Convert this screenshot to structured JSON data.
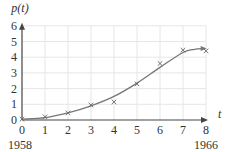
{
  "chart_data": {
    "type": "scatter",
    "title": "",
    "ylabel": "p(t)",
    "xlabel": "t",
    "x": [
      0,
      1,
      2,
      3,
      4,
      5,
      6,
      7,
      8
    ],
    "series": [
      {
        "name": "observed",
        "marker": "x",
        "values": [
          0.05,
          0.2,
          0.45,
          0.95,
          1.15,
          2.3,
          3.6,
          4.45,
          4.4
        ]
      },
      {
        "name": "fitted curve",
        "type": "line",
        "x": [
          0,
          1,
          2,
          3,
          4,
          5,
          6,
          7,
          7.5,
          7.9
        ],
        "values": [
          0.05,
          0.15,
          0.45,
          0.9,
          1.5,
          2.35,
          3.35,
          4.3,
          4.5,
          4.55
        ]
      }
    ],
    "xticks": [
      "0",
      "1",
      "2",
      "3",
      "4",
      "5",
      "6",
      "7",
      "8"
    ],
    "yticks": [
      "0",
      "1",
      "2",
      "3",
      "4",
      "5",
      "6"
    ],
    "xlim": [
      0,
      8
    ],
    "ylim": [
      0,
      6
    ],
    "annotations": [
      {
        "x": 0,
        "text": "1958"
      },
      {
        "x": 8,
        "text": "1966"
      }
    ],
    "grid": true,
    "legend": "none"
  },
  "colors": {
    "axis": "#444444",
    "grid": "#e6e6e6",
    "curve": "#777777",
    "marker": "#666666",
    "text": "#333333"
  }
}
